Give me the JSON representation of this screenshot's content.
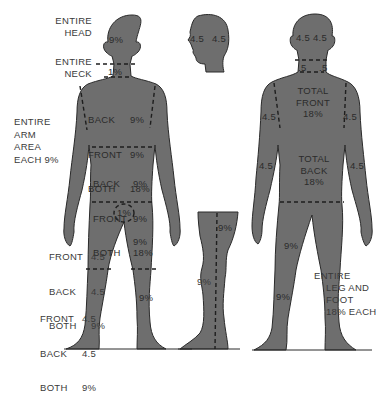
{
  "colors": {
    "figure_fill": "#6e6e6e",
    "figure_outline": "#2a2a2a",
    "text": "#3a3a3a",
    "background": "#ffffff"
  },
  "front_figure": {
    "head_label": [
      "ENTIRE",
      "HEAD"
    ],
    "head_value": "9%",
    "neck_label": [
      "ENTIRE",
      "NECK"
    ],
    "neck_value": "1%",
    "arm_label": [
      "ENTIRE",
      "ARM",
      "AREA",
      "EACH 9%"
    ],
    "chest": {
      "rows": [
        [
          "BACK",
          "9%"
        ],
        [
          "FRONT",
          "9%"
        ],
        [
          "BOTH",
          "18%"
        ]
      ]
    },
    "abdomen": {
      "rows": [
        [
          "BACK",
          "9%"
        ],
        [
          "FRONT",
          "9%"
        ],
        [
          "BOTH",
          "18%"
        ]
      ]
    },
    "groin_value": "1%",
    "thigh_left": {
      "rows": [
        [
          "FRONT",
          "4.5"
        ],
        [
          "BACK",
          "4.5"
        ],
        [
          "BOTH",
          "9%"
        ]
      ]
    },
    "thigh_right_value": "9%",
    "lower_leg_left": {
      "rows": [
        [
          "FRONT",
          "4.5"
        ],
        [
          "BACK",
          "4.5"
        ],
        [
          "BOTH",
          "9%"
        ]
      ]
    },
    "lower_leg_right_value": "9%"
  },
  "side_head": {
    "left_value": "4.5",
    "right_value": "4.5"
  },
  "side_leg": {
    "upper_value": "9%",
    "lower_value": "9%"
  },
  "back_figure": {
    "head_left": "4.5",
    "head_right": "4.5",
    "neck_left": ".5",
    "neck_right": ".5",
    "upper_arm_left": "4.5",
    "upper_arm_right": "4.5",
    "lower_arm_left": "4.5",
    "lower_arm_right": "4.5",
    "total_front": [
      "TOTAL",
      "FRONT",
      "18%"
    ],
    "total_back": [
      "TOTAL",
      "BACK",
      "18%"
    ],
    "thigh_value": "9%",
    "lower_leg_value": "9%",
    "leg_label": [
      "ENTIRE",
      "LEG AND",
      "FOOT",
      "18% EACH"
    ]
  }
}
